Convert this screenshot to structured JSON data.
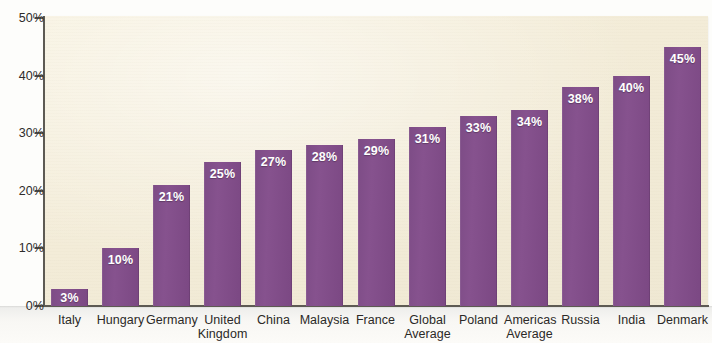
{
  "chart_data": {
    "type": "bar",
    "title": "",
    "subtitle": "",
    "xlabel": "",
    "ylabel": "",
    "ylim": [
      0,
      50
    ],
    "ytick_labels": [
      "0%",
      "10%",
      "20%",
      "30%",
      "40%",
      "50%"
    ],
    "ytick_values": [
      0,
      10,
      20,
      30,
      40,
      50
    ],
    "grid": false,
    "legend": false,
    "legend_position": "none",
    "value_label_suffix": "%",
    "categories": [
      "Italy",
      "Hungary",
      "Germany",
      "United Kingdom",
      "China",
      "Malaysia",
      "France",
      "Global Average",
      "Poland",
      "Americas Average",
      "Russia",
      "India",
      "Denmark"
    ],
    "category_lines": [
      [
        "Italy"
      ],
      [
        "Hungary"
      ],
      [
        "Germany"
      ],
      [
        "United",
        "Kingdom"
      ],
      [
        "China"
      ],
      [
        "Malaysia"
      ],
      [
        "France"
      ],
      [
        "Global",
        "Average"
      ],
      [
        "Poland"
      ],
      [
        "Americas",
        "Average"
      ],
      [
        "Russia"
      ],
      [
        "India"
      ],
      [
        "Denmark"
      ]
    ],
    "values": [
      3,
      10,
      21,
      25,
      27,
      28,
      29,
      31,
      33,
      34,
      38,
      40,
      45
    ],
    "value_labels": [
      "3%",
      "10%",
      "21%",
      "25%",
      "27%",
      "28%",
      "29%",
      "31%",
      "33%",
      "34%",
      "38%",
      "40%",
      "45%"
    ],
    "colors": {
      "bar": "#7d4c86",
      "plot_background": "#f3ecd8",
      "page_background": "#fdfdfb",
      "axis": "#5d5a53",
      "tick_label": "#2e2c2a",
      "value_label": "#ffffff"
    }
  }
}
